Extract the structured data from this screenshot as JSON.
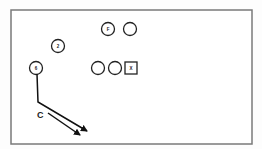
{
  "diagram": {
    "type": "play-diagram",
    "frame": {
      "x": 11,
      "y": 10,
      "width": 241,
      "height": 134,
      "stroke": "#7a7a7a"
    },
    "players": [
      {
        "id": "p-top-labeled",
        "shape": "circle",
        "label": "F",
        "cx": 108,
        "cy": 29,
        "r": 6.5
      },
      {
        "id": "p-top-plain",
        "shape": "circle",
        "label": "",
        "cx": 130,
        "cy": 29,
        "r": 6.5
      },
      {
        "id": "p-two",
        "shape": "circle",
        "label": "2",
        "cx": 58,
        "cy": 46,
        "r": 6.5
      },
      {
        "id": "p-six",
        "shape": "circle",
        "label": "6",
        "cx": 36,
        "cy": 68,
        "r": 6.5
      },
      {
        "id": "p-line-1",
        "shape": "circle",
        "label": "",
        "cx": 98,
        "cy": 68,
        "r": 6.5
      },
      {
        "id": "p-line-2",
        "shape": "circle",
        "label": "",
        "cx": 115,
        "cy": 68,
        "r": 6.5
      },
      {
        "id": "p-square",
        "shape": "square",
        "label": "X",
        "cx": 131,
        "cy": 68,
        "size": 12
      }
    ],
    "route": {
      "points": "37,74 38,102 87,131"
    },
    "second_arrow": {
      "points": "48,113 80,135"
    },
    "route_label": {
      "text": "C",
      "x": 37,
      "y": 118
    }
  }
}
